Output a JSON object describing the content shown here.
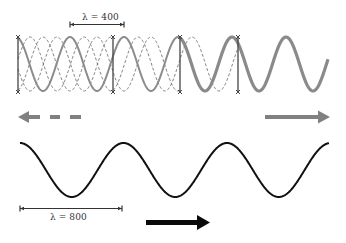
{
  "labels": {
    "top_wavelength": "λ = 400",
    "bottom_wavelength": "λ = 800"
  },
  "colors": {
    "gray_wave": "#8a8a8a",
    "dashed_wave": "#777777",
    "black_wave": "#111111",
    "gray_arrow": "#808080",
    "black_arrow": "#0a0a0a",
    "marker": "#444444"
  },
  "top_panel": {
    "description": "Superposed short-wavelength waves (λ = 400): several dashed phase-shifted sinusoids plus a solid gray sinusoid, segmented by vertical bars",
    "wavelength_value": 400,
    "vertical_bar_x": [
      18,
      113,
      180,
      238
    ],
    "dashed_wave_count": 3,
    "arrows": [
      {
        "direction": "left",
        "style": "dashed",
        "color": "gray"
      },
      {
        "direction": "right",
        "style": "solid",
        "color": "gray"
      }
    ]
  },
  "bottom_panel": {
    "description": "Single black sinusoid with longer wavelength (λ = 800)",
    "wavelength_value": 800,
    "arrows": [
      {
        "direction": "right",
        "style": "solid",
        "color": "black"
      }
    ]
  }
}
